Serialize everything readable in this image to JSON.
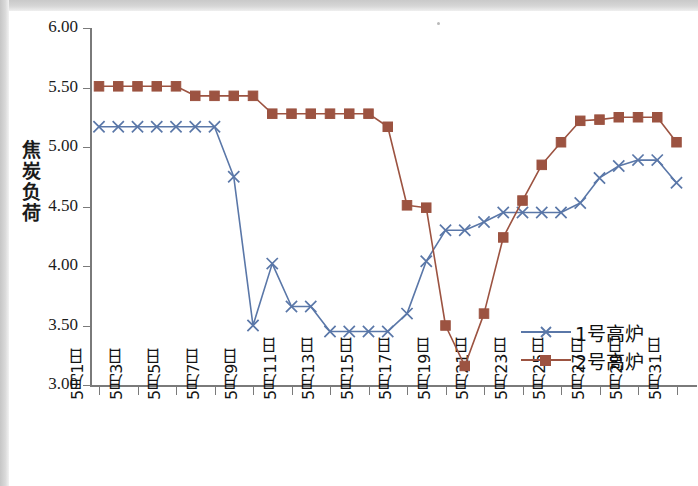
{
  "chart_data": {
    "type": "line",
    "title": "",
    "xlabel": "",
    "ylabel": "焦炭负荷",
    "ylim": [
      3.0,
      6.0
    ],
    "ytick_labels": [
      "6.00",
      "5.50",
      "5.00",
      "4.50",
      "4.00",
      "3.50",
      "3.00"
    ],
    "ytick_values": [
      6.0,
      5.5,
      5.0,
      4.5,
      4.0,
      3.5,
      3.0
    ],
    "grid": false,
    "legend_position": "inside-lower-right",
    "categories": [
      "5月1日",
      "5月2日",
      "5月3日",
      "5月4日",
      "5月5日",
      "5月6日",
      "5月7日",
      "5月8日",
      "5月9日",
      "5月10日",
      "5月11日",
      "5月12日",
      "5月13日",
      "5月14日",
      "5月15日",
      "5月16日",
      "5月17日",
      "5月18日",
      "5月19日",
      "5月20日",
      "5月21日",
      "5月22日",
      "5月23日",
      "5月24日",
      "5月25日",
      "5月26日",
      "5月27日",
      "5月28日",
      "5月29日",
      "5月30日",
      "5月31日"
    ],
    "xtick_labels": [
      "5月1日",
      "5月3日",
      "5月5日",
      "5月7日",
      "5月9日",
      "5月11日",
      "5月13日",
      "5月15日",
      "5月17日",
      "5月19日",
      "5月21日",
      "5月23日",
      "5月25日",
      "5月27日",
      "5月29日",
      "5月31日"
    ],
    "series": [
      {
        "name": "1号高炉",
        "color": "#5a77a8",
        "marker": "x",
        "values": [
          5.17,
          5.17,
          5.17,
          5.17,
          5.17,
          5.17,
          5.17,
          4.75,
          3.5,
          4.02,
          3.66,
          3.66,
          3.45,
          3.45,
          3.45,
          3.45,
          3.6,
          4.04,
          4.3,
          4.3,
          4.37,
          4.45,
          4.45,
          4.45,
          4.45,
          4.53,
          4.74,
          4.84,
          4.89,
          4.89,
          4.7
        ]
      },
      {
        "name": "2号高炉",
        "color": "#9c5341",
        "marker": "square",
        "values": [
          5.51,
          5.51,
          5.51,
          5.51,
          5.51,
          5.43,
          5.43,
          5.43,
          5.43,
          5.28,
          5.28,
          5.28,
          5.28,
          5.28,
          5.28,
          5.17,
          4.51,
          4.49,
          3.5,
          3.16,
          3.6,
          4.24,
          4.55,
          4.85,
          5.04,
          5.22,
          5.23,
          5.25,
          5.25,
          5.25,
          5.04
        ]
      }
    ]
  },
  "legend": {
    "items": [
      {
        "label": "1号高炉"
      },
      {
        "label": "2号高炉"
      }
    ]
  },
  "axis": {
    "y_title_chars": [
      "焦",
      "炭",
      "负",
      "荷"
    ]
  }
}
